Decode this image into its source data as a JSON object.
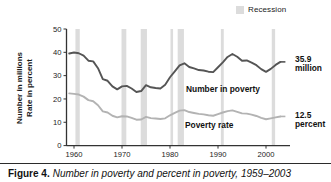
{
  "figure": {
    "caption_number": "Figure 4.",
    "caption_text": "Number in poverty and percent in poverty, 1959–2003"
  },
  "legend": {
    "recession_label": "Recession",
    "recession_color": "#dcdcdc",
    "swatch_icon": "recession-swatch-icon"
  },
  "axes": {
    "y_title_line1": "Number in millions",
    "y_title_line2": "Rate in percent",
    "y_ticks": [
      "0",
      "10",
      "20",
      "30",
      "40",
      "50"
    ],
    "x_ticks": [
      "1960",
      "1970",
      "1980",
      "1990",
      "2000"
    ]
  },
  "annotations": {
    "number_in_poverty": "Number in poverty",
    "poverty_rate": "Poverty rate",
    "end_number_line1": "35.9",
    "end_number_line2": "million",
    "end_rate_line1": "12.5",
    "end_rate_line2": "percent"
  },
  "colors": {
    "number_line": "#555555",
    "rate_line": "#b3b3b3",
    "axis": "#333333",
    "recession_band": "#dcdcdc",
    "background": "#ffffff",
    "text": "#111111"
  },
  "chart_data": {
    "type": "line",
    "title": "Number in poverty and percent in poverty, 1959–2003",
    "xlabel": "",
    "ylabel": "Number in millions / Rate in percent",
    "xlim": [
      1959,
      2003
    ],
    "ylim": [
      0,
      50
    ],
    "grid": false,
    "legend_position": "top-right",
    "x": [
      1959,
      1960,
      1961,
      1962,
      1963,
      1964,
      1965,
      1966,
      1967,
      1968,
      1969,
      1970,
      1971,
      1972,
      1973,
      1974,
      1975,
      1976,
      1977,
      1978,
      1979,
      1980,
      1981,
      1982,
      1983,
      1984,
      1985,
      1986,
      1987,
      1988,
      1989,
      1990,
      1991,
      1992,
      1993,
      1994,
      1995,
      1996,
      1997,
      1998,
      1999,
      2000,
      2001,
      2002,
      2003
    ],
    "series": [
      {
        "name": "Number in poverty",
        "unit": "millions",
        "color": "#555555",
        "end_value": 35.9,
        "values": [
          39.5,
          39.9,
          39.6,
          38.6,
          36.4,
          36.1,
          33.2,
          28.5,
          27.8,
          25.4,
          24.1,
          25.4,
          25.6,
          24.5,
          23.0,
          23.4,
          25.9,
          25.0,
          24.7,
          24.5,
          26.1,
          29.3,
          31.8,
          34.4,
          35.3,
          33.7,
          33.1,
          32.4,
          32.2,
          31.7,
          31.5,
          33.6,
          35.7,
          38.0,
          39.3,
          38.1,
          36.4,
          36.5,
          35.6,
          34.5,
          32.8,
          31.6,
          32.9,
          34.6,
          35.9
        ]
      },
      {
        "name": "Poverty rate",
        "unit": "percent",
        "color": "#b3b3b3",
        "end_value": 12.5,
        "values": [
          22.4,
          22.2,
          21.9,
          21.0,
          19.5,
          19.0,
          17.3,
          14.7,
          14.2,
          12.8,
          12.1,
          12.6,
          12.5,
          11.9,
          11.1,
          11.2,
          12.3,
          11.8,
          11.6,
          11.4,
          11.7,
          13.0,
          14.0,
          15.0,
          15.2,
          14.4,
          14.0,
          13.6,
          13.4,
          13.0,
          12.8,
          13.5,
          14.2,
          14.8,
          15.1,
          14.5,
          13.8,
          13.7,
          13.3,
          12.7,
          11.9,
          11.3,
          11.7,
          12.1,
          12.5
        ]
      }
    ],
    "recessions": [
      {
        "start": 1960.3,
        "end": 1961.2
      },
      {
        "start": 1969.9,
        "end": 1970.9
      },
      {
        "start": 1973.9,
        "end": 1975.2
      },
      {
        "start": 1980.1,
        "end": 1980.6
      },
      {
        "start": 1981.6,
        "end": 1982.9
      },
      {
        "start": 1990.6,
        "end": 1991.2
      },
      {
        "start": 2001.2,
        "end": 2001.9
      }
    ]
  }
}
